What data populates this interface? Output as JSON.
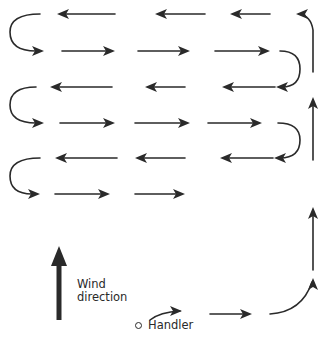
{
  "diagram": {
    "type": "search-pattern",
    "colors": {
      "ink": "#2a2a2a",
      "background": "#ffffff"
    },
    "labels": {
      "wind_line1": "Wind",
      "wind_line2": "direction",
      "handler": "Handler"
    },
    "start_path": {
      "segments": [
        {
          "d": "M150 320 Q160 312 180 311",
          "head": [
            182,
            311,
            "right"
          ]
        },
        {
          "d": "M210 314 L248 314",
          "head": [
            252,
            314,
            "right"
          ]
        },
        {
          "d": "M270 314 Q302 312 312 282",
          "head": [
            313,
            278,
            "up"
          ]
        }
      ]
    },
    "vertical_leg": {
      "segments": [
        {
          "d": "M313 270 L313 210",
          "head": [
            313,
            207,
            "up"
          ]
        },
        {
          "d": "M313 160 L313 100",
          "head": [
            313,
            97,
            "up"
          ]
        },
        {
          "d": "M313 72 L313 30 Q311 16 299 14",
          "head": [
            296,
            14,
            "left"
          ]
        }
      ]
    },
    "rows": [
      {
        "y": 14,
        "dir": "left",
        "arrows": [
          [
            270,
            230
          ],
          [
            205,
            155
          ],
          [
            115,
            57
          ]
        ]
      },
      {
        "y": 51,
        "dir": "right",
        "arrows": [
          [
            62,
            115
          ],
          [
            138,
            190
          ],
          [
            215,
            270
          ]
        ]
      },
      {
        "y": 87,
        "dir": "left",
        "arrows": [
          [
            275,
            222
          ],
          [
            185,
            145
          ],
          [
            112,
            50
          ]
        ]
      },
      {
        "y": 123,
        "dir": "right",
        "arrows": [
          [
            60,
            115
          ],
          [
            135,
            190
          ],
          [
            208,
            262
          ]
        ]
      },
      {
        "y": 158,
        "dir": "left",
        "arrows": [
          [
            273,
            220
          ],
          [
            185,
            135
          ],
          [
            117,
            55
          ]
        ]
      },
      {
        "y": 194,
        "dir": "right",
        "arrows": [
          [
            55,
            110
          ],
          [
            135,
            185
          ]
        ]
      }
    ],
    "turns": [
      {
        "name": "turn-left-1",
        "d": "M40 14 Q10 14 10 32 Q10 51 36 51",
        "head": [
          44,
          51,
          "right"
        ]
      },
      {
        "name": "turn-right-1",
        "d": "M280 51 Q300 51 300 69 Q300 87 282 87",
        "head": [
          276,
          87,
          "left"
        ]
      },
      {
        "name": "turn-left-2",
        "d": "M36 87 Q10 87 10 105 Q10 123 36 123",
        "head": [
          44,
          123,
          "right"
        ]
      },
      {
        "name": "turn-right-2",
        "d": "M278 123 Q300 123 300 140 Q300 158 280 158",
        "head": [
          274,
          158,
          "left"
        ]
      },
      {
        "name": "turn-left-3",
        "d": "M40 158 Q10 158 10 176 Q10 194 32 194",
        "head": [
          40,
          194,
          "right"
        ]
      }
    ],
    "wind_arrow": {
      "x": 59,
      "y_top": 246,
      "y_bottom": 320
    }
  }
}
